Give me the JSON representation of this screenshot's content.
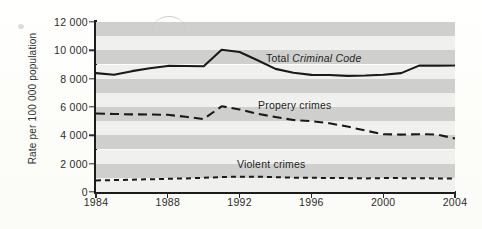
{
  "chart_data": {
    "type": "line",
    "title": "",
    "xlabel": "",
    "ylabel": "Rate per 100 000 population",
    "xlim": [
      1984,
      2004
    ],
    "ylim": [
      0,
      12000
    ],
    "grid": "horizontal-alternating-bands",
    "legend_position": "inline-labels",
    "x": [
      1984,
      1985,
      1986,
      1987,
      1988,
      1989,
      1990,
      1991,
      1992,
      1993,
      1994,
      1995,
      1996,
      1997,
      1998,
      1999,
      2000,
      2001,
      2002,
      2003,
      2004
    ],
    "y_ticks": [
      "0",
      "2 000",
      "4 000",
      "6 000",
      "8 000",
      "10 000",
      "12 000"
    ],
    "y_tick_values": [
      0,
      2000,
      4000,
      6000,
      8000,
      10000,
      12000
    ],
    "x_ticks": [
      "1984",
      "1988",
      "1992",
      "1996",
      "2000",
      "2004"
    ],
    "x_tick_values": [
      1984,
      1988,
      1992,
      1996,
      2000,
      2004
    ],
    "series": [
      {
        "name": "Total Criminal Code",
        "label_plain": "Total ",
        "label_italic": "Criminal Code",
        "style": "solid",
        "color": "#1a1a1a",
        "values": [
          8390,
          8280,
          8530,
          8740,
          8900,
          8890,
          8880,
          10040,
          9880,
          9300,
          8690,
          8420,
          8270,
          8260,
          8200,
          8220,
          8280,
          8390,
          8920,
          8920,
          8930
        ]
      },
      {
        "name": "Propery crimes",
        "label_plain": "Propery crimes",
        "style": "long-dash",
        "color": "#1a1a1a",
        "values": [
          5540,
          5510,
          5480,
          5470,
          5450,
          5310,
          5150,
          6050,
          5830,
          5520,
          5290,
          5080,
          5000,
          4850,
          4620,
          4340,
          4080,
          4050,
          4080,
          4060,
          3780
        ]
      },
      {
        "name": "Violent crimes",
        "label_plain": "Violent crimes",
        "style": "short-dash",
        "color": "#1a1a1a",
        "values": [
          820,
          840,
          870,
          900,
          930,
          960,
          1000,
          1060,
          1080,
          1080,
          1050,
          1010,
          1000,
          990,
          980,
          960,
          980,
          980,
          970,
          960,
          950
        ]
      }
    ],
    "band_colors": {
      "light": "#f0f0ee",
      "dark": "#cfcfcd"
    },
    "axis_color": "#1c1c1c"
  }
}
